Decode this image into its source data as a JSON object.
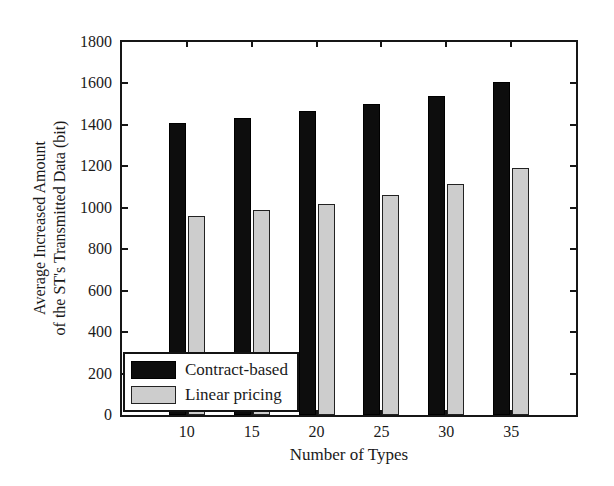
{
  "figure": {
    "background": "#ffffff",
    "axis_color": "#161616",
    "text_color": "#1a1a1a"
  },
  "chart_data": {
    "type": "bar",
    "title": "",
    "categories": [
      "10",
      "15",
      "20",
      "25",
      "30",
      "35"
    ],
    "series": [
      {
        "name": "Contract-based",
        "color": "#0d0d0d",
        "values": [
          1410,
          1435,
          1465,
          1500,
          1540,
          1605
        ]
      },
      {
        "name": "Linear pricing",
        "color": "#cdcdcd",
        "values": [
          960,
          990,
          1020,
          1060,
          1115,
          1190
        ]
      }
    ],
    "xlabel": "Number of Types",
    "ylabel": "Average Increased Amount of the ST's Transmitted Data (bit)",
    "ylabel_lines": [
      "Average Increased Amount",
      "of the ST's Transmitted Data (bit)"
    ],
    "ylim": [
      0,
      1800
    ],
    "ytick_step": 200,
    "yticks": [
      0,
      200,
      400,
      600,
      800,
      1000,
      1200,
      1400,
      1600,
      1800
    ],
    "grid": false,
    "legend_position": "bottom-left",
    "bar_edge_color": "#222222"
  }
}
